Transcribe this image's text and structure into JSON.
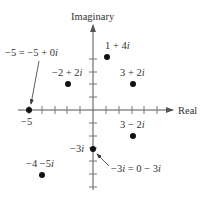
{
  "axes": {
    "x_label": "Real",
    "y_label": "Imaginary",
    "origin_px": [
      93,
      110
    ],
    "unit_px": 12.8,
    "x_ticks": [
      -5,
      -4,
      -3,
      -2,
      -1,
      1,
      2,
      3,
      4,
      5
    ],
    "y_ticks": [
      -6,
      -5,
      -4,
      -3,
      -2,
      -1,
      1,
      2,
      3,
      4
    ],
    "axis_color": "#555555"
  },
  "points": [
    {
      "id": "p-neg5",
      "re": -5,
      "im": 0,
      "label": "−5 = −5 + 0i",
      "tick_label": "−5"
    },
    {
      "id": "p-neg2-2i",
      "re": -2,
      "im": 2,
      "label": "−2 + 2i"
    },
    {
      "id": "p-1-4i",
      "re": 1,
      "im": 4,
      "label": "1 + 4i"
    },
    {
      "id": "p-3-2i",
      "re": 3,
      "im": 2,
      "label": "3 + 2i"
    },
    {
      "id": "p-3-neg2i",
      "re": 3,
      "im": -2,
      "label": "3 − 2i"
    },
    {
      "id": "p-neg3i",
      "re": 0,
      "im": -3,
      "label": "−3i = 0 − 3i",
      "tick_label": "−3i"
    },
    {
      "id": "p-neg4-neg5i",
      "re": -4,
      "im": -5,
      "label": "−4 −5i"
    }
  ],
  "labels": {
    "real": "Real",
    "imaginary": "Imaginary",
    "neg5_eq": "−5 = −5 + 0",
    "neg5_tick": "−5",
    "neg2_2i": "−2 + 2",
    "one_4i": "1 + 4",
    "three_2i": "3 + 2",
    "three_neg2i": "3 − 2",
    "neg3i_tick": "−3",
    "neg3i_eq": "−3",
    "neg3i_eq_rest": " = 0 − 3",
    "neg4_neg5i": "−4 −5",
    "i": "i"
  },
  "colors": {
    "point": "#111111",
    "axis": "#555555",
    "text": "#333333"
  }
}
